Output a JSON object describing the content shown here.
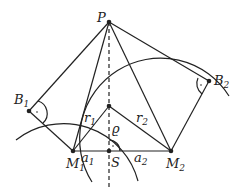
{
  "diagram": {
    "type": "geometry",
    "points": {
      "P": {
        "label": "P",
        "x": 109,
        "y": 22
      },
      "B1": {
        "label": "B",
        "sub": "1",
        "x": 29,
        "y": 111
      },
      "B2": {
        "label": "B",
        "sub": "2",
        "x": 209,
        "y": 81
      },
      "X": {
        "x": 109,
        "y": 106
      },
      "M1": {
        "label": "M",
        "sub": "1",
        "x": 73,
        "y": 151
      },
      "S": {
        "label": "S",
        "x": 109,
        "y": 151
      },
      "M2": {
        "label": "M",
        "sub": "2",
        "x": 171,
        "y": 151
      }
    },
    "labels": {
      "r1": {
        "text": "r",
        "sub": "1"
      },
      "r2": {
        "text": "r",
        "sub": "2"
      },
      "rho": {
        "text": "ϱ"
      },
      "a1": {
        "text": "a",
        "sub": "1"
      },
      "a2": {
        "text": "a",
        "sub": "2"
      }
    }
  }
}
